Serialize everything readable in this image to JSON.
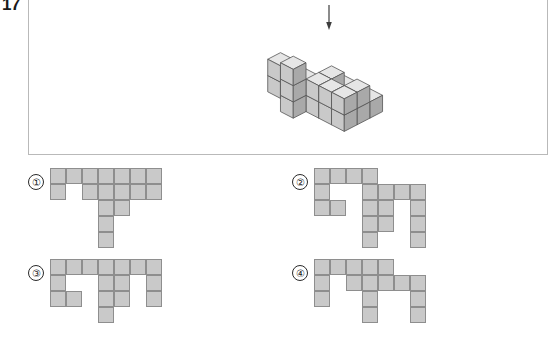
{
  "question_number": "17",
  "arrow": {
    "direction": "down",
    "name": "viewing-direction-arrow"
  },
  "colors": {
    "cube_top": "#e6e6e6",
    "cube_front": "#c9c9c9",
    "cube_side": "#a9a9a9",
    "cube_stroke": "#555555",
    "cell_fill": "#c9c9c9",
    "cell_stroke": "#8e8e8e",
    "panel_border": "#b9b9b9"
  },
  "figure": {
    "type": "isometric-cube-stack",
    "cell": 22,
    "cubes": [
      {
        "x": 0,
        "y": 2,
        "z": 0
      },
      {
        "x": 0,
        "y": 2,
        "z": 1
      },
      {
        "x": 1,
        "y": 2,
        "z": 0
      },
      {
        "x": 0,
        "y": 1,
        "z": 0
      },
      {
        "x": 1,
        "y": 1,
        "z": 0
      },
      {
        "x": 2,
        "y": 3,
        "z": 0
      },
      {
        "x": 2,
        "y": 3,
        "z": 1
      },
      {
        "x": 2,
        "y": 3,
        "z": 2
      },
      {
        "x": 2,
        "y": 2,
        "z": 0
      },
      {
        "x": 3,
        "y": 2,
        "z": 0
      },
      {
        "x": 3,
        "y": 2,
        "z": 1
      },
      {
        "x": 4,
        "y": 2,
        "z": 0
      },
      {
        "x": 4,
        "y": 2,
        "z": 1
      },
      {
        "x": 2,
        "y": 1,
        "z": 0
      },
      {
        "x": 3,
        "y": 1,
        "z": 0
      },
      {
        "x": 3,
        "y": 1,
        "z": 1
      },
      {
        "x": 3,
        "y": 0,
        "z": 0
      },
      {
        "x": 4,
        "y": 1,
        "z": 0
      },
      {
        "x": 5,
        "y": 1,
        "z": 0
      },
      {
        "x": 5,
        "y": 1,
        "z": 1
      },
      {
        "x": 5,
        "y": 2,
        "z": 0
      },
      {
        "x": 5,
        "y": 2,
        "z": 1
      },
      {
        "x": 4,
        "y": 0,
        "z": 0
      },
      {
        "x": 5,
        "y": 0,
        "z": 0
      }
    ]
  },
  "options": [
    {
      "label": "①",
      "name": "option-1",
      "grid": {
        "cols": 7,
        "rows": 5,
        "filled": [
          [
            0,
            0
          ],
          [
            1,
            0
          ],
          [
            2,
            0
          ],
          [
            3,
            0
          ],
          [
            4,
            0
          ],
          [
            5,
            0
          ],
          [
            6,
            0
          ],
          [
            0,
            1
          ],
          [
            2,
            1
          ],
          [
            3,
            1
          ],
          [
            4,
            1
          ],
          [
            5,
            1
          ],
          [
            6,
            1
          ],
          [
            3,
            2
          ],
          [
            4,
            2
          ],
          [
            3,
            3
          ],
          [
            3,
            4
          ]
        ]
      }
    },
    {
      "label": "②",
      "name": "option-2",
      "grid": {
        "cols": 7,
        "rows": 5,
        "filled": [
          [
            0,
            0
          ],
          [
            1,
            0
          ],
          [
            2,
            0
          ],
          [
            3,
            0
          ],
          [
            0,
            1
          ],
          [
            3,
            1
          ],
          [
            4,
            1
          ],
          [
            5,
            1
          ],
          [
            6,
            1
          ],
          [
            0,
            2
          ],
          [
            1,
            2
          ],
          [
            3,
            2
          ],
          [
            4,
            2
          ],
          [
            6,
            2
          ],
          [
            3,
            3
          ],
          [
            4,
            3
          ],
          [
            6,
            3
          ],
          [
            3,
            4
          ],
          [
            6,
            4
          ]
        ]
      }
    },
    {
      "label": "③",
      "name": "option-3",
      "grid": {
        "cols": 7,
        "rows": 4,
        "filled": [
          [
            0,
            0
          ],
          [
            1,
            0
          ],
          [
            2,
            0
          ],
          [
            3,
            0
          ],
          [
            4,
            0
          ],
          [
            5,
            0
          ],
          [
            6,
            0
          ],
          [
            0,
            1
          ],
          [
            3,
            1
          ],
          [
            4,
            1
          ],
          [
            6,
            1
          ],
          [
            0,
            2
          ],
          [
            1,
            2
          ],
          [
            3,
            2
          ],
          [
            4,
            2
          ],
          [
            6,
            2
          ],
          [
            3,
            3
          ]
        ]
      }
    },
    {
      "label": "④",
      "name": "option-4",
      "grid": {
        "cols": 7,
        "rows": 4,
        "filled": [
          [
            0,
            0
          ],
          [
            1,
            0
          ],
          [
            2,
            0
          ],
          [
            3,
            0
          ],
          [
            4,
            0
          ],
          [
            0,
            1
          ],
          [
            2,
            1
          ],
          [
            3,
            1
          ],
          [
            4,
            1
          ],
          [
            5,
            1
          ],
          [
            6,
            1
          ],
          [
            0,
            2
          ],
          [
            3,
            2
          ],
          [
            6,
            2
          ],
          [
            3,
            3
          ],
          [
            6,
            3
          ]
        ]
      }
    }
  ]
}
